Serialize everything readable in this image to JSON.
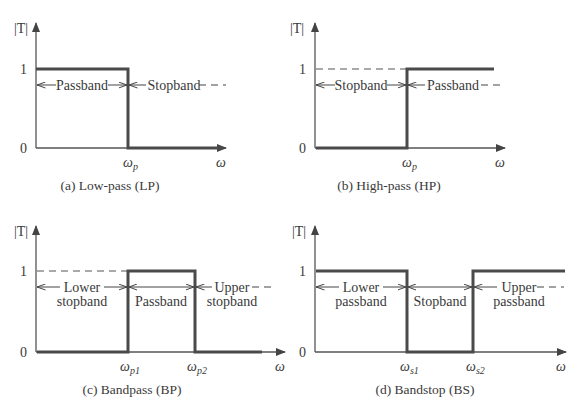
{
  "figure": {
    "panels": [
      {
        "id": "a",
        "caption": "(a) Low-pass (LP)",
        "y_axis_label": "|T|",
        "y_ticks": [
          "1",
          "0"
        ],
        "x_axis_label": "ω",
        "x_ticks": [
          {
            "base": "ω",
            "sub": "p"
          }
        ],
        "regions": [
          {
            "line1": "Passband",
            "line2": ""
          },
          {
            "line1": "Stopband",
            "line2": ""
          }
        ]
      },
      {
        "id": "b",
        "caption": "(b) High-pass (HP)",
        "y_axis_label": "|T|",
        "y_ticks": [
          "1",
          "0"
        ],
        "x_axis_label": "ω",
        "x_ticks": [
          {
            "base": "ω",
            "sub": "p"
          }
        ],
        "regions": [
          {
            "line1": "Stopband",
            "line2": ""
          },
          {
            "line1": "Passband",
            "line2": ""
          }
        ]
      },
      {
        "id": "c",
        "caption": "(c) Bandpass (BP)",
        "y_axis_label": "|T|",
        "y_ticks": [
          "1",
          "0"
        ],
        "x_axis_label": "ω",
        "x_ticks": [
          {
            "base": "ω",
            "sub": "p1"
          },
          {
            "base": "ω",
            "sub": "p2"
          }
        ],
        "regions": [
          {
            "line1": "Lower",
            "line2": "stopband"
          },
          {
            "line1": "Passband",
            "line2": ""
          },
          {
            "line1": "Upper",
            "line2": "stopband"
          }
        ]
      },
      {
        "id": "d",
        "caption": "(d) Bandstop (BS)",
        "y_axis_label": "|T|",
        "y_ticks": [
          "1",
          "0"
        ],
        "x_axis_label": "ω",
        "x_ticks": [
          {
            "base": "ω",
            "sub": "s1"
          },
          {
            "base": "ω",
            "sub": "s2"
          }
        ],
        "regions": [
          {
            "line1": "Lower",
            "line2": "passband"
          },
          {
            "line1": "Stopband",
            "line2": ""
          },
          {
            "line1": "Upper",
            "line2": "passband"
          }
        ]
      }
    ],
    "colors": {
      "trace": "#4a4a4a",
      "axis": "#555555",
      "text": "#3a3a3a"
    }
  }
}
